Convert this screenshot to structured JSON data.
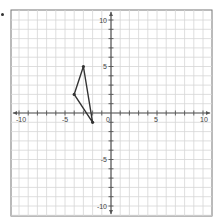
{
  "chart_data": {
    "type": "scatter",
    "title": "",
    "xlabel": "",
    "ylabel": "",
    "xlim": [
      -10,
      10
    ],
    "ylim": [
      -10,
      10
    ],
    "grid": true,
    "x_tick_labels": [
      "-10",
      "-5",
      "0",
      "5",
      "10"
    ],
    "y_tick_labels": [
      "10",
      "5",
      "-5",
      "-10"
    ],
    "series": [
      {
        "name": "triangle",
        "shape": "polygon",
        "points": [
          [
            -3,
            5
          ],
          [
            -4,
            2
          ],
          [
            -2,
            -1
          ]
        ]
      }
    ]
  },
  "colors": {
    "grid": "#d6d6d6",
    "axis": "#555555",
    "border": "#777777",
    "shape": "#333333"
  }
}
